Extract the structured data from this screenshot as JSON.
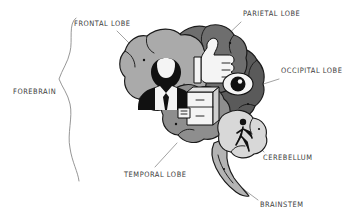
{
  "figure": {
    "style": "hand-drawn illustration",
    "background_color": "#ffffff"
  },
  "bracket": {
    "label": "FOREBRAIN",
    "name": "forebrain-bracket",
    "color": "#8a8a8a"
  },
  "labels": [
    {
      "id": "frontal",
      "text": "FRONTAL LOBE",
      "x": 74,
      "y": 24,
      "anchor": "start"
    },
    {
      "id": "parietal",
      "text": "PARIETAL LOBE",
      "x": 244,
      "y": 16,
      "anchor": "start"
    },
    {
      "id": "occipital",
      "text": "OCCIPITAL LOBE",
      "x": 282,
      "y": 71,
      "anchor": "start"
    },
    {
      "id": "cerebellum",
      "text": "CEREBELLUM",
      "x": 264,
      "y": 158,
      "anchor": "start"
    },
    {
      "id": "temporal",
      "text": "TEMPORAL LOBE",
      "x": 125,
      "y": 175,
      "anchor": "start"
    },
    {
      "id": "brainstem",
      "text": "BRAINSTEM",
      "x": 261,
      "y": 205,
      "anchor": "start"
    },
    {
      "id": "forebrain",
      "text": "FOREBRAIN",
      "x": 13,
      "y": 91,
      "anchor": "start"
    }
  ],
  "regions": [
    {
      "id": "frontal",
      "name": "frontal-lobe",
      "label": "FRONTAL LOBE",
      "fill": "#aaaaaa",
      "icon": "businessman-icon",
      "icon_meaning": "personality / executive function"
    },
    {
      "id": "parietal",
      "name": "parietal-lobe",
      "label": "PARIETAL LOBE",
      "fill": "#6e6e6e",
      "icon": "thumbs-up-icon",
      "icon_meaning": "touch / sensation"
    },
    {
      "id": "occipital",
      "name": "occipital-lobe",
      "label": "OCCIPITAL LOBE",
      "fill": "#5a5a5a",
      "icon": "eye-icon",
      "icon_meaning": "vision"
    },
    {
      "id": "temporal",
      "name": "temporal-lobe",
      "label": "TEMPORAL LOBE",
      "fill": "#8e8e8e",
      "icon": "filing-cabinet-icon",
      "icon_meaning": "memory"
    },
    {
      "id": "cerebellum",
      "name": "cerebellum",
      "label": "CEREBELLUM",
      "fill": "#d8d8d8",
      "icon": "walking-person-icon",
      "icon_meaning": "balance / coordination"
    },
    {
      "id": "brainstem",
      "name": "brainstem",
      "label": "BRAINSTEM",
      "fill": "#b4b4b4",
      "icon": null,
      "icon_meaning": "vital functions"
    }
  ],
  "leaders": [
    {
      "from_label": "FRONTAL LOBE",
      "name": "leader-frontal"
    },
    {
      "from_label": "PARIETAL LOBE",
      "name": "leader-parietal"
    },
    {
      "from_label": "OCCIPITAL LOBE",
      "name": "leader-occipital"
    },
    {
      "from_label": "CEREBELLUM",
      "name": "leader-cerebellum"
    },
    {
      "from_label": "TEMPORAL LOBE",
      "name": "leader-temporal"
    },
    {
      "from_label": "BRAINSTEM",
      "name": "leader-brainstem"
    }
  ]
}
